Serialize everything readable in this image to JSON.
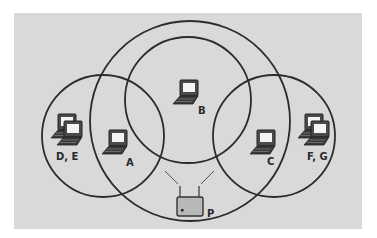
{
  "diagram": {
    "type": "wireless-network-hidden-terminal",
    "background_color": "#d9d9d9",
    "line_color": "#2b2b2b",
    "access_point": {
      "label": "P",
      "icon": "access-point-icon"
    },
    "ranges": [
      {
        "id": "P",
        "description": "access point P range"
      },
      {
        "id": "B",
        "description": "station B range"
      },
      {
        "id": "A",
        "description": "station A range"
      },
      {
        "id": "C",
        "description": "station C range"
      }
    ],
    "stations": [
      {
        "id": "A",
        "label": "A",
        "icon": "laptop-icon"
      },
      {
        "id": "B",
        "label": "B",
        "icon": "laptop-icon"
      },
      {
        "id": "C",
        "label": "C",
        "icon": "laptop-icon"
      },
      {
        "id": "DE",
        "label": "D, E",
        "icon": "laptop-pair-icon"
      },
      {
        "id": "FG",
        "label": "F, G",
        "icon": "laptop-pair-icon"
      }
    ]
  }
}
